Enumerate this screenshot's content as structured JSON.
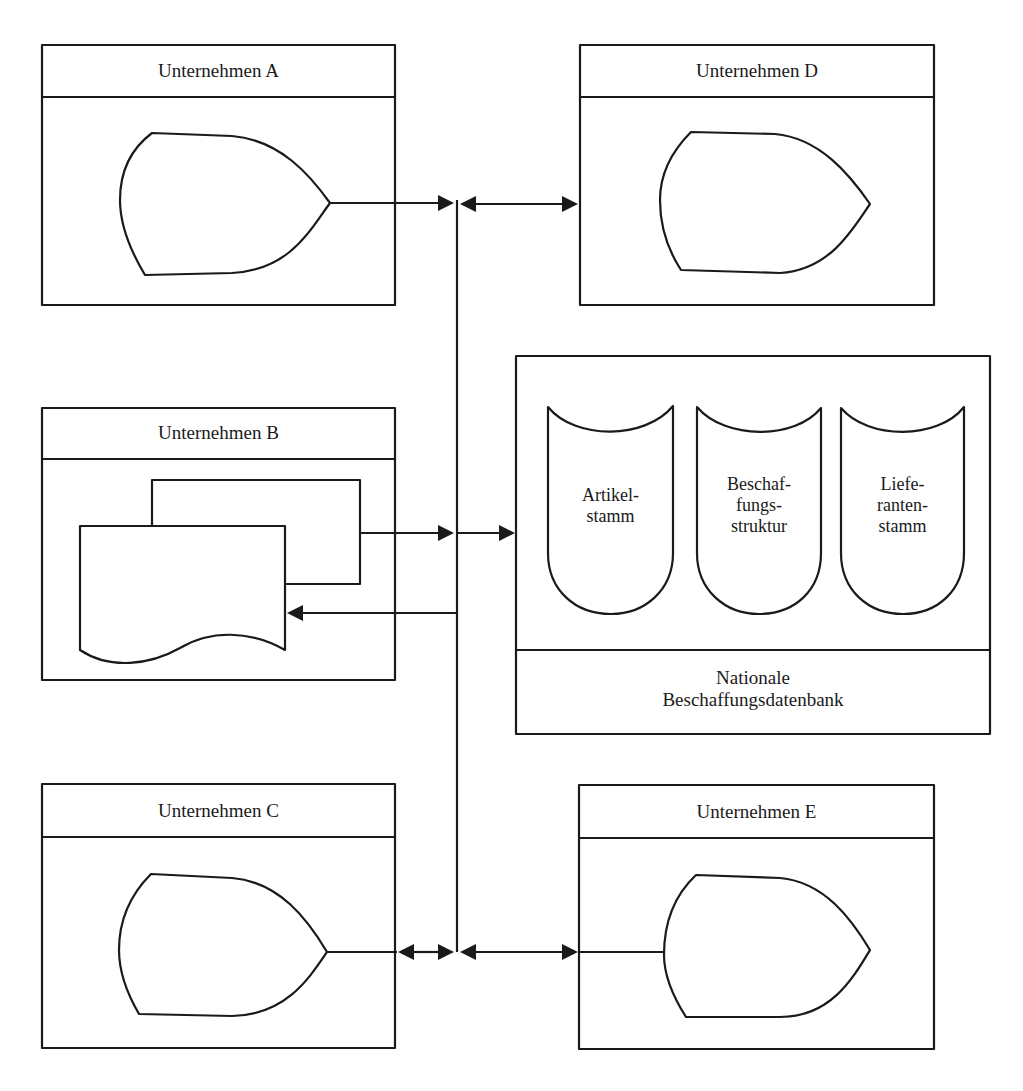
{
  "companies": {
    "a": {
      "title": "Unternehmen A",
      "symbol": "display-terminal"
    },
    "b": {
      "title": "Unternehmen B",
      "symbol": "document-stack"
    },
    "c": {
      "title": "Unternehmen C",
      "symbol": "display-terminal"
    },
    "d": {
      "title": "Unternehmen D",
      "symbol": "display-terminal"
    },
    "e": {
      "title": "Unternehmen E",
      "symbol": "display-terminal"
    }
  },
  "database": {
    "title_line1": "Nationale",
    "title_line2": "Beschaffungsdatenbank",
    "stores": [
      {
        "label": "Artikel-\nstamm"
      },
      {
        "label": "Beschaf-\nfungs-\nstruktur"
      },
      {
        "label": "Liefe-\nranten-\nstamm"
      }
    ]
  },
  "connections": [
    {
      "from": "Unternehmen A",
      "to": "bus",
      "direction": "one-way"
    },
    {
      "from": "bus",
      "to": "Unternehmen D",
      "direction": "two-way"
    },
    {
      "from": "Unternehmen B",
      "to": "bus",
      "direction": "one-way"
    },
    {
      "from": "bus",
      "to": "Nationale Beschaffungsdatenbank",
      "direction": "one-way"
    },
    {
      "from": "bus",
      "to": "Unternehmen B",
      "direction": "one-way"
    },
    {
      "from": "Unternehmen C",
      "to": "bus",
      "direction": "two-way"
    },
    {
      "from": "bus",
      "to": "Unternehmen E",
      "direction": "two-way"
    }
  ],
  "colors": {
    "stroke": "#1a1a1a",
    "background": "#ffffff"
  }
}
